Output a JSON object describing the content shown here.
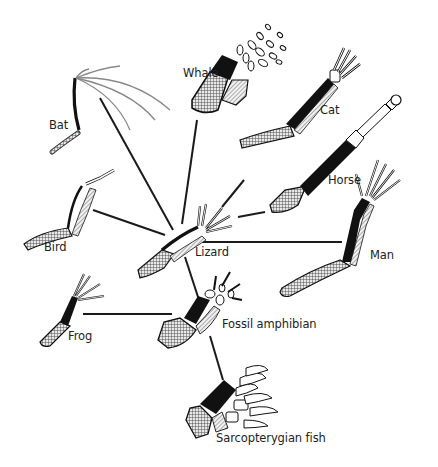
{
  "diagram": {
    "type": "homologous-forelimb-diagram",
    "center_node": "Lizard",
    "labels": {
      "bat": "Bat",
      "whale": "Whale",
      "cat": "Cat",
      "horse": "Horse",
      "bird": "Bird",
      "lizard": "Lizard",
      "man": "Man",
      "frog": "Frog",
      "fossil_amphibian": "Fossil amphibian",
      "sarcopterygian_fish": "Sarcopterygian fish"
    },
    "edges": [
      {
        "from": "Lizard",
        "to": "Bat"
      },
      {
        "from": "Lizard",
        "to": "Whale"
      },
      {
        "from": "Lizard",
        "to": "Cat"
      },
      {
        "from": "Lizard",
        "to": "Horse"
      },
      {
        "from": "Lizard",
        "to": "Bird"
      },
      {
        "from": "Lizard",
        "to": "Man"
      },
      {
        "from": "Lizard",
        "to": "Fossil amphibian"
      },
      {
        "from": "Frog",
        "to": "Fossil amphibian"
      },
      {
        "from": "Fossil amphibian",
        "to": "Sarcopterygian fish"
      }
    ],
    "legend_patterns": {
      "humerus": "cross-hatched",
      "radius": "black",
      "ulna": "diagonal-hatched",
      "carpals_digits": "white outline"
    },
    "colors": {
      "ink": "#1a1a1a",
      "radius_fill": "#111111",
      "hatch_fill": "#9a9a9a",
      "background": "#ffffff"
    }
  }
}
